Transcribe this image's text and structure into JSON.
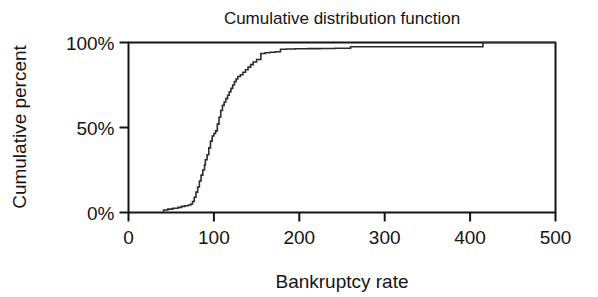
{
  "chart_data": {
    "type": "line",
    "title": "Cumulative distribution function",
    "xlabel": "Bankruptcy rate",
    "ylabel": "Cumulative percent",
    "xlim": [
      0,
      500
    ],
    "ylim": [
      0,
      100
    ],
    "xticks": [
      0,
      100,
      200,
      300,
      400,
      500
    ],
    "xtick_labels": [
      "0",
      "100",
      "200",
      "300",
      "400",
      "500"
    ],
    "yticks": [
      0,
      50,
      100
    ],
    "ytick_labels": [
      "0%",
      "50%",
      "100%"
    ],
    "grid": false,
    "legend": "none",
    "line_color": "#2b2b2b",
    "axis_color": "#141414",
    "background": "#ffffff",
    "series": [
      {
        "name": "Cumulative percent",
        "step": "post",
        "x": [
          41,
          41,
          46,
          52,
          58,
          62,
          66,
          70,
          73,
          75,
          77,
          79,
          81,
          83,
          85,
          87,
          89,
          90,
          92,
          94,
          96,
          98,
          100,
          102,
          104,
          106,
          108,
          110,
          112,
          114,
          116,
          118,
          120,
          122,
          124,
          126,
          128,
          131,
          134,
          137,
          140,
          143,
          146,
          150,
          155,
          160,
          166,
          172,
          178,
          185,
          195,
          210,
          225,
          242,
          260,
          290,
          330,
          370,
          412,
          415
        ],
        "y": [
          0,
          1.5,
          2.0,
          2.5,
          3.0,
          3.6,
          4.0,
          4.4,
          5.0,
          6.5,
          9.0,
          12.0,
          15.0,
          18.5,
          22.0,
          25.0,
          28.0,
          31.0,
          34.0,
          38.0,
          42.0,
          45.0,
          46.5,
          48.0,
          52.0,
          56.0,
          60.0,
          63.0,
          65.0,
          67.0,
          69.0,
          71.0,
          73.0,
          75.0,
          77.0,
          78.5,
          80.0,
          81.0,
          82.5,
          84.0,
          85.5,
          87.0,
          88.5,
          90.0,
          93.5,
          94.0,
          94.3,
          94.6,
          96.0,
          96.2,
          96.3,
          96.4,
          96.5,
          96.6,
          97.5,
          97.5,
          97.5,
          97.5,
          97.5,
          100.0
        ]
      }
    ]
  }
}
